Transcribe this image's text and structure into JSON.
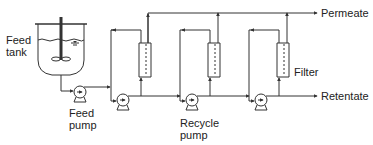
{
  "diagram": {
    "type": "process-flow",
    "colors": {
      "line": "#333333",
      "text": "#222222",
      "background": "#ffffff"
    },
    "labels": {
      "feed_tank_line1": "Feed",
      "feed_tank_line2": "tank",
      "feed_pump_line1": "Feed",
      "feed_pump_line2": "pump",
      "recycle_pump_line1": "Recycle",
      "recycle_pump_line2": "pump",
      "filter": "Filter",
      "permeate": "Permeate",
      "retentate": "Retentate"
    },
    "components": [
      {
        "id": "feed-tank",
        "kind": "stirred-tank"
      },
      {
        "id": "feed-pump",
        "kind": "pump"
      },
      {
        "id": "stage-1",
        "kind": "recycle-loop",
        "pump": "recycle-pump-1",
        "filter": "filter-1"
      },
      {
        "id": "stage-2",
        "kind": "recycle-loop",
        "pump": "recycle-pump-2",
        "filter": "filter-2"
      },
      {
        "id": "stage-3",
        "kind": "recycle-loop",
        "pump": "recycle-pump-3",
        "filter": "filter-3"
      }
    ],
    "outputs": [
      "Permeate",
      "Retentate"
    ]
  }
}
